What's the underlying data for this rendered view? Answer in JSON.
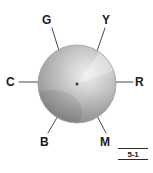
{
  "figure": {
    "caption": "5-1",
    "center_dot": true,
    "sphere": {
      "center_x": 77,
      "center_y": 84,
      "radius": 39,
      "highlight_color": "#fbfbfb",
      "base_color": "#b4b4b4",
      "shadow_color": "#8d8d8d",
      "edge_color": "#9a9a9a"
    },
    "leader_line_color": "#4a4a4a",
    "labels": [
      {
        "id": "G",
        "text": "G",
        "name": "label-green",
        "line": {
          "x1": 52,
          "y1": 28,
          "x2": 60,
          "y2": 54
        }
      },
      {
        "id": "Y",
        "text": "Y",
        "name": "label-yellow",
        "line": {
          "x1": 105,
          "y1": 28,
          "x2": 96,
          "y2": 54
        }
      },
      {
        "id": "C",
        "text": "C",
        "name": "label-cyan",
        "line": {
          "x1": 19,
          "y1": 82,
          "x2": 39,
          "y2": 82
        }
      },
      {
        "id": "R",
        "text": "R",
        "name": "label-red",
        "line": {
          "x1": 116,
          "y1": 82,
          "x2": 133,
          "y2": 82
        }
      },
      {
        "id": "B",
        "text": "B",
        "name": "label-blue",
        "line": {
          "x1": 48,
          "y1": 133,
          "x2": 59,
          "y2": 114
        }
      },
      {
        "id": "M",
        "text": "M",
        "name": "label-magenta",
        "line": {
          "x1": 106,
          "y1": 133,
          "x2": 96,
          "y2": 114
        }
      }
    ]
  }
}
